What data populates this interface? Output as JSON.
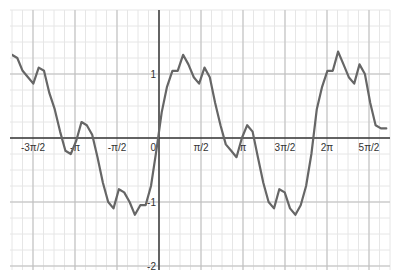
{
  "chart_data": {
    "type": "line",
    "title": "",
    "xlabel": "",
    "ylabel": "",
    "grid": true,
    "legend": null,
    "xlim": [
      -5.2,
      8.7
    ],
    "ylim": [
      -2.05,
      2.1
    ],
    "x_ticks": [
      {
        "value": -4.712,
        "label": "-3π/2"
      },
      {
        "value": -3.1416,
        "label": "-π"
      },
      {
        "value": -1.5708,
        "label": "-π/2"
      },
      {
        "value": 0,
        "label": "0"
      },
      {
        "value": 1.5708,
        "label": "π/2"
      },
      {
        "value": 3.1416,
        "label": "π"
      },
      {
        "value": 4.712,
        "label": "3π/2"
      },
      {
        "value": 6.2832,
        "label": "2π"
      },
      {
        "value": 7.854,
        "label": "5π/2"
      }
    ],
    "y_ticks": [
      {
        "value": 1,
        "label": "1"
      },
      {
        "value": -1,
        "label": "-1"
      },
      {
        "value": -2,
        "label": "-2"
      }
    ],
    "series": [
      {
        "name": "f(x) ≈ sin(x) with high-frequency ripple",
        "color": "#666666",
        "x": [
          -5.5,
          -5.3,
          -5.1,
          -4.9,
          -4.7,
          -4.5,
          -4.3,
          -4.1,
          -3.9,
          -3.7,
          -3.5,
          -3.3,
          -3.1,
          -2.9,
          -2.7,
          -2.5,
          -2.3,
          -2.1,
          -1.9,
          -1.7,
          -1.5,
          -1.3,
          -1.1,
          -0.9,
          -0.7,
          -0.5,
          -0.3,
          -0.1,
          0.1,
          0.3,
          0.5,
          0.7,
          0.9,
          1.1,
          1.3,
          1.5,
          1.7,
          1.9,
          2.1,
          2.3,
          2.5,
          2.7,
          2.9,
          3.1,
          3.3,
          3.5,
          3.7,
          3.9,
          4.1,
          4.3,
          4.5,
          4.7,
          4.9,
          5.1,
          5.3,
          5.5,
          5.7,
          5.9,
          6.1,
          6.3,
          6.5,
          6.7,
          6.9,
          7.1,
          7.3,
          7.5,
          7.7,
          7.9,
          8.1,
          8.3,
          8.5
        ],
        "y": [
          1.3,
          1.25,
          1.05,
          0.95,
          0.85,
          1.1,
          1.05,
          0.7,
          0.45,
          0.1,
          -0.2,
          -0.25,
          -0.05,
          0.25,
          0.2,
          0.05,
          -0.3,
          -0.7,
          -1.0,
          -1.1,
          -0.8,
          -0.85,
          -1.0,
          -1.2,
          -1.05,
          -1.05,
          -0.75,
          -0.2,
          0.4,
          0.8,
          1.05,
          1.05,
          1.3,
          1.15,
          0.95,
          0.85,
          1.1,
          0.95,
          0.55,
          0.2,
          -0.1,
          -0.2,
          -0.3,
          0.0,
          0.2,
          0.1,
          -0.3,
          -0.7,
          -1.0,
          -1.1,
          -0.8,
          -0.85,
          -1.1,
          -1.2,
          -1.05,
          -0.75,
          -0.25,
          0.45,
          0.8,
          1.05,
          1.05,
          1.35,
          1.15,
          0.95,
          0.85,
          1.15,
          1.0,
          0.55,
          0.2,
          0.15,
          0.15
        ]
      }
    ]
  }
}
